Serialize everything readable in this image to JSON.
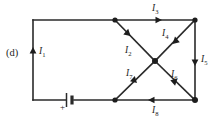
{
  "figure": {
    "panel_label": "(d)",
    "type": "circuit-diagram",
    "background_color": "#ffffff",
    "wire_color": "#2a2a2a",
    "node_color": "#1d1d1d"
  },
  "battery": {
    "polarity_label": "+"
  },
  "currents": [
    {
      "id": "I1",
      "symbol": "I",
      "subscript": "1",
      "direction": "up",
      "branch": "left-vertical-wire"
    },
    {
      "id": "I2",
      "symbol": "I",
      "subscript": "2",
      "direction": "down-right",
      "branch": "top-middle-to-center-diagonal"
    },
    {
      "id": "I3",
      "symbol": "I",
      "subscript": "3",
      "direction": "right",
      "branch": "top-wire"
    },
    {
      "id": "I4",
      "symbol": "I",
      "subscript": "4",
      "direction": "down-left",
      "branch": "top-right-to-center-diagonal"
    },
    {
      "id": "I5",
      "symbol": "I",
      "subscript": "5",
      "direction": "down",
      "branch": "right-vertical-wire"
    },
    {
      "id": "I6",
      "symbol": "I",
      "subscript": "6",
      "direction": "down-right",
      "branch": "center-to-bottom-right-diagonal"
    },
    {
      "id": "I7",
      "symbol": "I",
      "subscript": "7",
      "direction": "up-right",
      "branch": "bottom-middle-to-center-diagonal"
    },
    {
      "id": "I8",
      "symbol": "I",
      "subscript": "8",
      "direction": "left",
      "branch": "bottom-wire"
    }
  ],
  "nodes": [
    {
      "id": "top-middle-node",
      "x": 115,
      "y": 20
    },
    {
      "id": "top-right-node",
      "x": 195,
      "y": 20
    },
    {
      "id": "center-node",
      "x": 155,
      "y": 61
    },
    {
      "id": "bottom-middle-node",
      "x": 115,
      "y": 100
    },
    {
      "id": "bottom-right-node",
      "x": 195,
      "y": 100
    }
  ]
}
